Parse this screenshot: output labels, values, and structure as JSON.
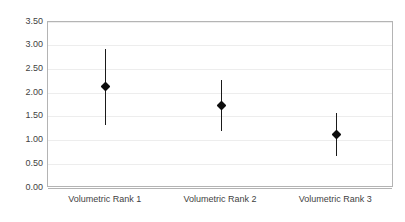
{
  "chart_data": {
    "type": "scatter",
    "title": "",
    "subtitle": "",
    "xlabel": "",
    "ylabel": "",
    "categories": [
      "Volumetric Rank 1",
      "Volumetric Rank 2",
      "Volumetric Rank 3"
    ],
    "values": [
      2.13,
      1.73,
      1.13
    ],
    "error_low": [
      1.33,
      1.2,
      0.68
    ],
    "error_high": [
      2.94,
      2.27,
      1.58
    ],
    "series": [
      {
        "name": "",
        "points": [
          {
            "category": "Volumetric Rank 1",
            "value": 2.13,
            "low": 1.33,
            "high": 2.94
          },
          {
            "category": "Volumetric Rank 2",
            "value": 1.73,
            "low": 1.2,
            "high": 2.27
          },
          {
            "category": "Volumetric Rank 3",
            "value": 1.13,
            "low": 0.68,
            "high": 1.58
          }
        ]
      }
    ],
    "ylim": [
      0.0,
      3.5
    ],
    "ytick_step": 0.5,
    "ytick_labels": [
      "3.50",
      "3.00",
      "2.50",
      "2.00",
      "1.50",
      "1.00",
      "0.50",
      "0.00"
    ],
    "ytick_values": [
      3.5,
      3.0,
      2.5,
      2.0,
      1.5,
      1.0,
      0.5,
      0.0
    ],
    "grid": true,
    "grid_axis": "y",
    "legend": false,
    "legend_position": "none",
    "marker_shape": "diamond",
    "colors": {
      "marker": "#0d0d0d",
      "errorbar": "#1a1a1a",
      "gridline": "#ededed",
      "axis": "#b4b4b4",
      "text": "#3f3f3f",
      "background": "#ffffff"
    }
  }
}
